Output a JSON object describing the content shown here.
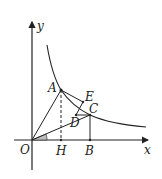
{
  "diagram": {
    "type": "coordinate-geometry",
    "axes": {
      "x_label": "x",
      "y_label": "y",
      "origin_label": "O"
    },
    "curve": "hyperbola y = k/x (first quadrant)",
    "points": {
      "O": "O",
      "A": "A",
      "B": "B",
      "C": "C",
      "D": "D",
      "E": "E",
      "H": "H"
    },
    "segments": [
      "OA",
      "OC",
      "AE",
      "ED",
      "DC",
      "CB",
      "AH (dashed)"
    ],
    "angle_marker": "angle at O between x-axis and OC (shaded)",
    "colors": {
      "stroke": "#222222",
      "angle_fill": "#bdbdbd"
    }
  }
}
